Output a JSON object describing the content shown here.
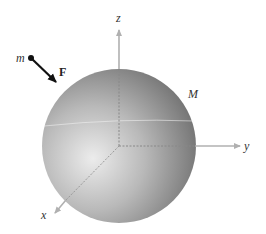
{
  "diagram": {
    "sphere": {
      "label": "M",
      "cx": 119,
      "cy": 146,
      "r": 77
    },
    "axes": {
      "z": {
        "label": "z"
      },
      "y": {
        "label": "y"
      },
      "x": {
        "label": "x"
      }
    },
    "particle": {
      "label": "m"
    },
    "force": {
      "label": "F"
    },
    "colors": {
      "axis": "#b0b0b0",
      "sphere_light": "#e6e6e6",
      "sphere_dark": "#6e6e6e",
      "arrow": "#111111"
    }
  }
}
